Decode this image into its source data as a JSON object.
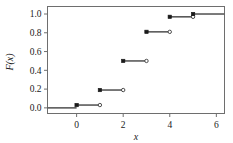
{
  "chart_data": {
    "type": "line",
    "title": "",
    "subtitle": "",
    "xlabel": "x",
    "ylabel": "F(x)",
    "xlim": [
      -1.25,
      6.35
    ],
    "ylim": [
      -0.06,
      1.08
    ],
    "grid": false,
    "legend": null,
    "x_ticks": [
      0,
      2,
      4,
      6
    ],
    "x_tick_labels": [
      "0",
      "2",
      "4",
      "6"
    ],
    "y_ticks": [
      0.0,
      0.2,
      0.4,
      0.6,
      0.8,
      1.0
    ],
    "y_tick_labels": [
      "0.0",
      "0.2",
      "0.4",
      "0.6",
      "0.8",
      "1.0"
    ],
    "x": [
      0,
      1,
      2,
      3,
      4,
      5
    ],
    "values": [
      0.03,
      0.19,
      0.5,
      0.81,
      0.97,
      1.0
    ],
    "steps": [
      {
        "x_start": -1.25,
        "x_end": 0.0,
        "y": 0.0,
        "left_marker": "none",
        "right_marker": "none"
      },
      {
        "x_start": 0.0,
        "x_end": 1.0,
        "y": 0.03,
        "left_marker": "filled",
        "right_marker": "open"
      },
      {
        "x_start": 1.0,
        "x_end": 2.0,
        "y": 0.19,
        "left_marker": "filled",
        "right_marker": "open"
      },
      {
        "x_start": 2.0,
        "x_end": 3.0,
        "y": 0.5,
        "left_marker": "filled",
        "right_marker": "open"
      },
      {
        "x_start": 3.0,
        "x_end": 4.0,
        "y": 0.81,
        "left_marker": "filled",
        "right_marker": "open"
      },
      {
        "x_start": 4.0,
        "x_end": 5.0,
        "y": 0.97,
        "left_marker": "filled",
        "right_marker": "open"
      },
      {
        "x_start": 5.0,
        "x_end": 6.35,
        "y": 1.0,
        "left_marker": "filled",
        "right_marker": "none"
      }
    ],
    "colors": {
      "line": "#5a5a5a",
      "marker_fill": "#1a1a1a",
      "marker_open_fill": "#ffffff",
      "marker_edge": "#3a3a3a",
      "axis": "#6e6e6e",
      "text": "#1a1a1a",
      "background": "#ffffff"
    }
  }
}
